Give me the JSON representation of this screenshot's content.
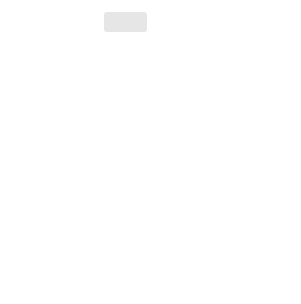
{
  "graph": {
    "function_label": "y = f(x)",
    "x_axis_label": "x",
    "y_axis_label": "y",
    "x_ticks": [
      "-5",
      "-4",
      "-3",
      "-2",
      "-1",
      "1",
      "2",
      "3",
      "4",
      "5"
    ],
    "y_ticks": [
      "4",
      "3",
      "2",
      "1",
      "-1",
      "-2",
      "-3",
      "-4"
    ],
    "points": [
      {
        "label": "(-2, 2)",
        "x": -2,
        "y": 2
      },
      {
        "label": "(0, 2)",
        "x": 0,
        "y": 2
      },
      {
        "label": "(2, 2)",
        "x": 2,
        "y": 2
      }
    ],
    "segment": {
      "from": [
        -2,
        2
      ],
      "to": [
        2,
        2
      ]
    },
    "colors": {
      "grid": "#dcdcdc",
      "axis": "#333333",
      "curve": "#555555",
      "bubble": "#e6e6e6"
    }
  },
  "exercises": [
    {
      "num": "1.",
      "lhs": "g(x) = ",
      "rhs": "f(x) + 1"
    },
    {
      "num": "2.",
      "lhs": "g(x) = ",
      "rhs": "f(x) − 1"
    },
    {
      "num": "3.",
      "lhs": "g(x) = ",
      "rhs": "f(x + 1)"
    },
    {
      "num": "4.",
      "lhs": "g(x) = ",
      "rhs": "f(x − 1)"
    },
    {
      "num": "5.",
      "lhs": "g(x) = ",
      "rhs": "f(x − 1) − 2"
    },
    {
      "num": "6.",
      "lhs": "g(x) = ",
      "rhs": "f(x + 1) + 2"
    },
    {
      "num": "7.",
      "lhs": "g(x) = ",
      "rhs": "f(−x)"
    },
    {
      "num": "8.",
      "lhs": "g(x) = ",
      "rhs": "−f(x)"
    },
    {
      "num": "9.",
      "lhs": "g(x) = ",
      "rhs": "−f(x) + 3"
    },
    {
      "num": "10.",
      "lhs": "g(x) = ",
      "rhs": "f(−x) + 3"
    },
    {
      "num": "11.",
      "lhs": "g(x) = ",
      "rhs_pre": "",
      "frac": [
        "1",
        "2"
      ],
      "rhs_post": "f(x)"
    },
    {
      "num": "12.",
      "lhs": "g(x) = ",
      "rhs": "2f(x)"
    },
    {
      "num": "13.",
      "lhs": "g(x) = ",
      "rhs_pre": "f(",
      "frac": [
        "1",
        "2"
      ],
      "rhs_post": "x)"
    },
    {
      "num": "14.",
      "lhs": "g(x) = ",
      "rhs": "f(2x)"
    },
    {
      "num": "15.",
      "lhs": "g(x) = ",
      "rhs_pre": "−f(",
      "frac": [
        "1",
        "2"
      ],
      "rhs_post": "x) + 1"
    },
    {
      "num": "16.",
      "lhs": "g(x) = ",
      "rhs": "−f(2x) − 1"
    }
  ]
}
